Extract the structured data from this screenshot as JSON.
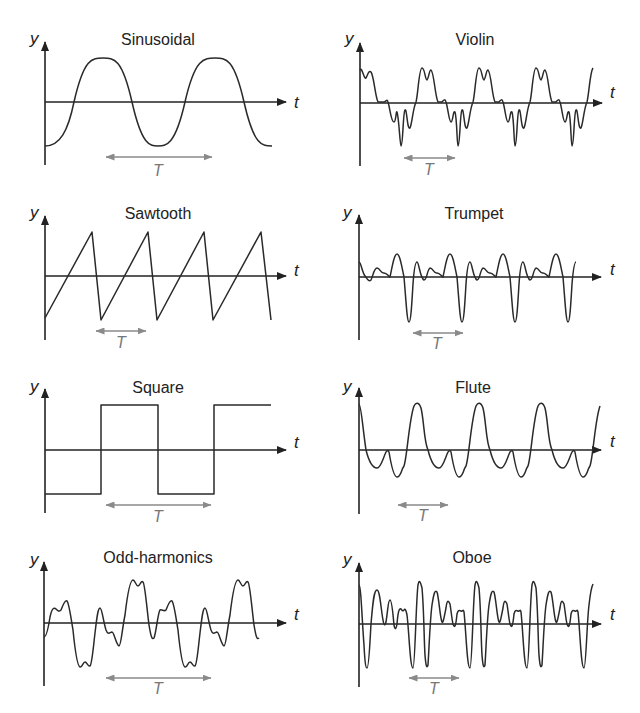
{
  "figure": {
    "panels": [
      {
        "id": "sinusoidal",
        "title": "Sinusoidal",
        "y_label": "y",
        "x_label": "t",
        "period_label": "T",
        "column": "left",
        "row": 1
      },
      {
        "id": "violin",
        "title": "Violin",
        "y_label": "y",
        "x_label": "t",
        "period_label": "T",
        "column": "right",
        "row": 1
      },
      {
        "id": "sawtooth",
        "title": "Sawtooth",
        "y_label": "y",
        "x_label": "t",
        "period_label": "T",
        "column": "left",
        "row": 2
      },
      {
        "id": "trumpet",
        "title": "Trumpet",
        "y_label": "y",
        "x_label": "t",
        "period_label": "T",
        "column": "right",
        "row": 2
      },
      {
        "id": "square",
        "title": "Square",
        "y_label": "y",
        "x_label": "t",
        "period_label": "T",
        "column": "left",
        "row": 3
      },
      {
        "id": "flute",
        "title": "Flute",
        "y_label": "y",
        "x_label": "t",
        "period_label": "T",
        "column": "right",
        "row": 3
      },
      {
        "id": "odd-harmonics",
        "title": "Odd-harmonics",
        "y_label": "y",
        "x_label": "t",
        "period_label": "T",
        "column": "left",
        "row": 4
      },
      {
        "id": "oboe",
        "title": "Oboe",
        "y_label": "y",
        "x_label": "t",
        "period_label": "T",
        "column": "right",
        "row": 4
      }
    ],
    "colors": {
      "waveform": "#2a2a2a",
      "axis": "#222222",
      "period_arrow": "#8a8a8a",
      "background": "#ffffff"
    }
  }
}
